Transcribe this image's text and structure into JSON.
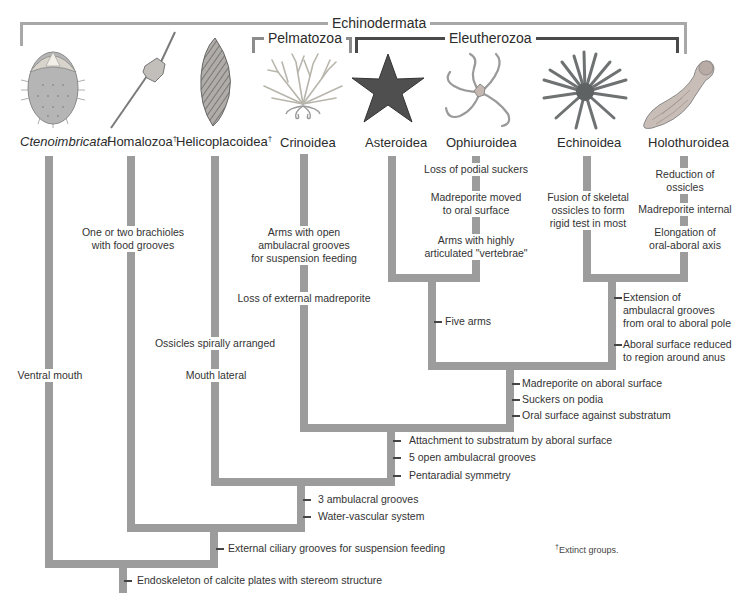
{
  "clades": {
    "echinodermata": "Echinodermata",
    "pelmatozoa": "Pelmatozoa",
    "eleutherozoa": "Eleutherozoa"
  },
  "taxa": [
    {
      "name": "Ctenoimbricata",
      "extinct": true,
      "italic": true,
      "icon": "ctenoimbricata-illustration"
    },
    {
      "name": "Homalozoa",
      "extinct": true,
      "italic": false,
      "icon": "homalozoa-illustration"
    },
    {
      "name": "Helicoplacoidea",
      "extinct": true,
      "italic": false,
      "icon": "helicoplacoidea-illustration"
    },
    {
      "name": "Crinoidea",
      "extinct": false,
      "italic": false,
      "icon": "crinoid-illustration"
    },
    {
      "name": "Asteroidea",
      "extinct": false,
      "italic": false,
      "icon": "sea-star-illustration"
    },
    {
      "name": "Ophiuroidea",
      "extinct": false,
      "italic": false,
      "icon": "brittle-star-illustration"
    },
    {
      "name": "Echinoidea",
      "extinct": false,
      "italic": false,
      "icon": "sea-urchin-illustration"
    },
    {
      "name": "Holothuroidea",
      "extinct": false,
      "italic": false,
      "icon": "sea-cucumber-illustration"
    }
  ],
  "dagger": "†",
  "characters": {
    "ctenoimbricata": [
      "Ventral mouth"
    ],
    "homalozoa": [
      "One or two brachioles",
      "with food grooves"
    ],
    "helicoplacoidea_1": "Ossicles spirally arranged",
    "helicoplacoidea_2": "Mouth lateral",
    "crinoidea_1": [
      "Arms with open",
      "ambulacral grooves",
      "for suspension feeding"
    ],
    "crinoidea_2": "Loss of external madreporite",
    "ophiuroidea_1": "Loss of podial suckers",
    "ophiuroidea_2": [
      "Madreporite moved",
      "to oral surface"
    ],
    "ophiuroidea_3": [
      "Arms with highly",
      "articulated \"vertebrae\""
    ],
    "echinoidea_1": [
      "Fusion of skeletal",
      "ossicles to form",
      "rigid test in most"
    ],
    "holothuroidea_1": [
      "Reduction of",
      "ossicles"
    ],
    "holothuroidea_2": "Madreporite internal",
    "holothuroidea_3": [
      "Elongation of",
      "oral-aboral axis"
    ],
    "asteroidea_ophiuroidea": "Five arms",
    "echinoidea_holothuroidea": [
      [
        "Extension of",
        "ambulacral grooves",
        "from oral to aboral pole"
      ],
      [
        "Aboral surface reduced",
        "to region around anus"
      ]
    ],
    "eleutherozoa": [
      "Madreporite on aboral surface",
      "Suckers on podia",
      "Oral surface against substratum"
    ],
    "pelmatozoa_eleutherozoa": [
      "Attachment to substratum by aboral surface",
      "5 open ambulacral grooves",
      "Pentaradial symmetry"
    ],
    "node_helico": [
      "3 ambulacral grooves",
      "Water-vascular system"
    ],
    "node_homalo": "External ciliary grooves for suspension feeding",
    "root": "Endoskeleton of calcite plates with stereom structure"
  },
  "footnote": "Extinct groups.",
  "colors": {
    "branch": "#9c9c9c",
    "bracket_dark": "#4a4a4a",
    "bracket_gray": "#8c8c8c"
  }
}
